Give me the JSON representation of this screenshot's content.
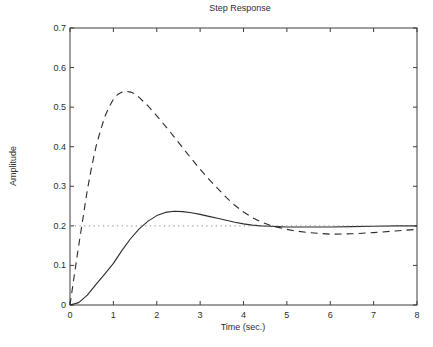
{
  "chart_data": {
    "type": "line",
    "title": "Step Response",
    "xlabel": "Time (sec.)",
    "ylabel": "Amplitude",
    "xlim": [
      0,
      8
    ],
    "ylim": [
      0,
      0.7
    ],
    "grid": false,
    "legend": "none",
    "background_color": "#ffffff",
    "axes_color": "#3d3d3d",
    "xticks": {
      "values": [
        0,
        1,
        2,
        3,
        4,
        5,
        6,
        7,
        8
      ],
      "labels": [
        "0",
        "1",
        "2",
        "3",
        "4",
        "5",
        "6",
        "7",
        "8"
      ]
    },
    "yticks": {
      "values": [
        0,
        0.1,
        0.2,
        0.3,
        0.4,
        0.5,
        0.6,
        0.7
      ],
      "labels": [
        "0",
        "0.1",
        "0.2",
        "0.3",
        "0.4",
        "0.5",
        "0.6",
        "0.7"
      ]
    },
    "series": [
      {
        "name": "dashed-response-curve",
        "style": "dashed",
        "color": "#2b2b2b",
        "peak": {
          "time": 1.3,
          "amplitude": 0.54
        },
        "final_value": 0.19,
        "x": [
          0,
          0.1,
          0.2,
          0.3,
          0.4,
          0.5,
          0.6,
          0.7,
          0.8,
          0.9,
          1.0,
          1.1,
          1.2,
          1.3,
          1.4,
          1.5,
          1.6,
          1.8,
          2.0,
          2.2,
          2.4,
          2.6,
          2.8,
          3.0,
          3.2,
          3.4,
          3.6,
          3.8,
          4.0,
          4.2,
          4.4,
          4.6,
          4.8,
          5.0,
          5.2,
          5.5,
          6.0,
          6.5,
          7.0,
          7.5,
          8.0
        ],
        "y": [
          0,
          0.075,
          0.15,
          0.22,
          0.29,
          0.35,
          0.4,
          0.44,
          0.475,
          0.5,
          0.52,
          0.532,
          0.538,
          0.54,
          0.538,
          0.533,
          0.524,
          0.503,
          0.478,
          0.452,
          0.425,
          0.397,
          0.37,
          0.343,
          0.318,
          0.295,
          0.272,
          0.252,
          0.235,
          0.221,
          0.21,
          0.202,
          0.196,
          0.191,
          0.187,
          0.183,
          0.179,
          0.18,
          0.183,
          0.187,
          0.191
        ]
      },
      {
        "name": "solid-response-curve",
        "style": "solid",
        "color": "#2b2b2b",
        "peak": {
          "time": 2.4,
          "amplitude": 0.237
        },
        "final_value": 0.2,
        "x": [
          0,
          0.2,
          0.4,
          0.6,
          0.8,
          1.0,
          1.2,
          1.4,
          1.6,
          1.8,
          2.0,
          2.2,
          2.4,
          2.6,
          2.8,
          3.0,
          3.2,
          3.4,
          3.6,
          3.8,
          4.0,
          4.2,
          4.4,
          4.6,
          4.8,
          5.0,
          5.5,
          6.0,
          6.5,
          7.0,
          7.5,
          8.0
        ],
        "y": [
          0,
          0.006,
          0.025,
          0.052,
          0.078,
          0.105,
          0.138,
          0.168,
          0.193,
          0.212,
          0.226,
          0.234,
          0.237,
          0.236,
          0.233,
          0.229,
          0.224,
          0.219,
          0.214,
          0.209,
          0.205,
          0.202,
          0.2,
          0.199,
          0.198,
          0.197,
          0.197,
          0.197,
          0.198,
          0.199,
          0.2,
          0.2
        ]
      },
      {
        "name": "steady-state-reference-line",
        "style": "dotted",
        "color": "#8f8f8f",
        "final_value": 0.2,
        "x": [
          0,
          8
        ],
        "y": [
          0.2,
          0.2
        ]
      }
    ]
  }
}
